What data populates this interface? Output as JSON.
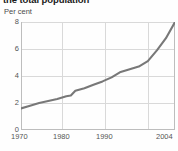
{
  "chart_data": {
    "type": "line",
    "title": "the total population",
    "subtitle": "Per cent",
    "xlabel": "",
    "ylabel": "Per cent",
    "xlim": [
      1970,
      2004
    ],
    "ylim": [
      0,
      8
    ],
    "grid": true,
    "legend": null,
    "line_color": "#787878",
    "grid_color": "#d9d9d9",
    "axis_color": "#bdbdbd",
    "background_color": "#fefefe",
    "text_color": "#555555",
    "title_color": "#1a1a1a",
    "yticks": [
      8,
      6,
      4,
      2,
      0
    ],
    "xticks": [
      1970,
      1980,
      1990,
      2004
    ],
    "xtick_positions": [
      1970,
      1980,
      1990,
      2004
    ],
    "gridline_years": [
      1970,
      1980,
      1990,
      2000,
      2004
    ],
    "series": [
      {
        "name": "Share of total population",
        "x": [
          1970,
          1972,
          1974,
          1976,
          1978,
          1980,
          1981,
          1982,
          1984,
          1986,
          1988,
          1990,
          1992,
          1994,
          1996,
          1998,
          2000,
          2002,
          2004
        ],
        "values": [
          1.6,
          1.8,
          2.0,
          2.15,
          2.3,
          2.5,
          2.55,
          2.9,
          3.1,
          3.35,
          3.6,
          3.9,
          4.3,
          4.5,
          4.7,
          5.1,
          5.9,
          6.8,
          8.0
        ]
      }
    ]
  }
}
